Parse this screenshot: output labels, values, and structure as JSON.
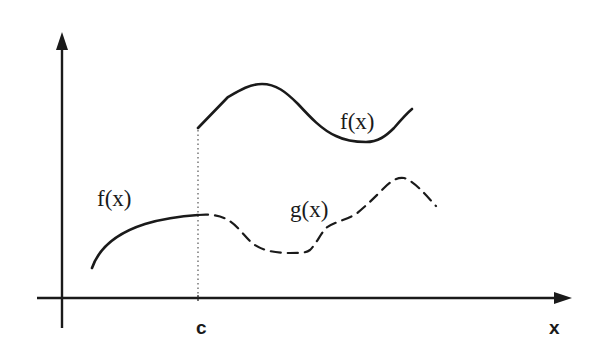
{
  "diagram": {
    "title": "",
    "labels": {
      "f_left": "f(x)",
      "f_right": "f(x)",
      "g": "g(x)",
      "c_tick": "c",
      "x_axis": "x"
    },
    "colors": {
      "ink": "#1a1a1a",
      "background": "#ffffff"
    },
    "axes": {
      "x_axis": {
        "label": "x",
        "has_arrow": true
      },
      "y_axis": {
        "label": "",
        "has_arrow": true
      },
      "marked_point": "c"
    },
    "curves": [
      {
        "name": "f(x) left branch",
        "style": "solid",
        "domain": "x < c",
        "shape": "concave rising curve approaching a limit at c"
      },
      {
        "name": "f(x) right branch",
        "style": "solid",
        "domain": "x >= c",
        "shape": "starts higher at c (jump), rises to a peak, dips to a trough, then rises"
      },
      {
        "name": "g(x)",
        "style": "dashed",
        "domain": "x >= c",
        "shape": "continues from left limit of f at c, dips, rises to a peak, then falls"
      },
      {
        "name": "vertical line at c",
        "style": "dotted"
      }
    ]
  }
}
